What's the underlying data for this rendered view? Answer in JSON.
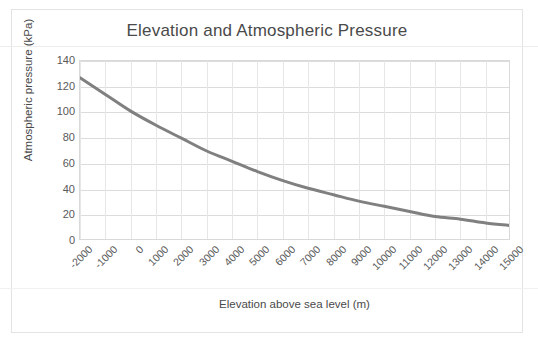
{
  "chart_data": {
    "type": "line",
    "title": "Elevation and Atmospheric Pressure",
    "xlabel": "Elevation above sea level (m)",
    "ylabel": "Atmospheric pressure (kPa)",
    "xlim": [
      -2000,
      15000
    ],
    "ylim": [
      0,
      140
    ],
    "xticks": [
      -2000,
      -1000,
      0,
      1000,
      2000,
      3000,
      4000,
      5000,
      6000,
      7000,
      8000,
      9000,
      10000,
      11000,
      12000,
      13000,
      14000,
      15000
    ],
    "xtick_labels": [
      "-2000",
      "-1000",
      "0",
      "1000",
      "2000",
      "3000",
      "4000",
      "5000",
      "6000",
      "7000",
      "8000",
      "9000",
      "10000",
      "11000",
      "12000",
      "13000",
      "14000",
      "15000"
    ],
    "yticks": [
      0,
      20,
      40,
      60,
      80,
      100,
      120,
      140
    ],
    "ytick_labels": [
      "0",
      "20",
      "40",
      "60",
      "80",
      "100",
      "120",
      "140"
    ],
    "grid": "both",
    "legend": "none",
    "series": [
      {
        "name": "Atmospheric pressure",
        "color": "#808080",
        "line_width": 3,
        "x": [
          -2000,
          -1000,
          0,
          1000,
          2000,
          3000,
          4000,
          5000,
          6000,
          7000,
          8000,
          9000,
          10000,
          11000,
          12000,
          13000,
          14000,
          15000
        ],
        "values": [
          127,
          114,
          101,
          90,
          80,
          70,
          62,
          54,
          47,
          41,
          36,
          31,
          27,
          23,
          19,
          17,
          14,
          12
        ]
      }
    ]
  },
  "colors": {
    "series": "#808080",
    "grid": "#dcdcdc",
    "grid_minor": "#e6e6e6",
    "text": "#595959",
    "title_text": "#4a4a4a",
    "frame": "#e3e3e3",
    "background": "#ffffff"
  }
}
